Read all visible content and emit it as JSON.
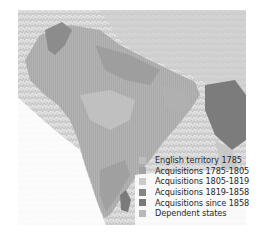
{
  "map": {
    "subject": "British territorial expansion in India",
    "colors": {
      "background": "#ffffff",
      "sea_fade": "#f2f2f2",
      "mountains": "#d6d6d6",
      "english_1785": "#bdbdbd",
      "acq_1785_1805": "#a4a4a4",
      "acq_1805_1819": "#c9c9c9",
      "acq_1819_1858": "#8a8a8a",
      "acq_since_1858": "#7c7c7c",
      "dependent_states": "#b4b4b4"
    }
  },
  "legend": {
    "items": [
      {
        "label": "English territory 1785",
        "color": "#bdbdbd"
      },
      {
        "label": "Acquisitions 1785-1805",
        "color": "#a2a2a2"
      },
      {
        "label": "Acquisitions 1805-1819",
        "color": "#cbcbcb"
      },
      {
        "label": "Acquisitions 1819-1858",
        "color": "#858585"
      },
      {
        "label": "Acquisitions since 1858",
        "color": "#7a7a7a"
      },
      {
        "label": "Dependent states",
        "color": "#b8b8b8"
      }
    ]
  }
}
